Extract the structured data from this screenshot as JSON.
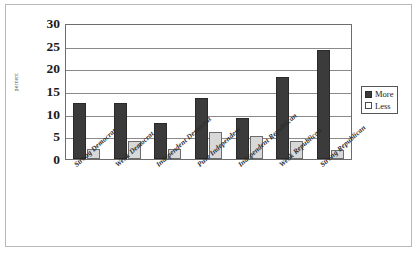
{
  "chart_data": {
    "type": "bar",
    "title": "",
    "xlabel": "",
    "ylabel": "percent",
    "ylim": [
      0,
      30
    ],
    "ytick_step": 5,
    "yticks": [
      "30",
      "25",
      "20",
      "15",
      "10",
      "5",
      "0"
    ],
    "grid": true,
    "legend_position": "right",
    "categories": [
      "Strong Democrat",
      "Weak Democrat",
      "Independent Democrat",
      "Pure Independent",
      "Independent Republican",
      "Weak Republican",
      "Strong Republican"
    ],
    "series": [
      {
        "name": "More",
        "color": "#3b3b3b",
        "values": [
          12.4,
          12.3,
          8.0,
          13.5,
          9.0,
          18.0,
          24.0
        ]
      },
      {
        "name": "Less",
        "color": "#d8d8d8",
        "values": [
          2.2,
          4.0,
          2.2,
          6.0,
          5.0,
          4.0,
          2.0
        ]
      }
    ]
  },
  "legend": {
    "items": [
      {
        "label": "More",
        "swatch": "filled-dark-square"
      },
      {
        "label": "Less",
        "swatch": "empty-white-square"
      }
    ]
  },
  "axes": {
    "y_axis_title": "percent"
  }
}
